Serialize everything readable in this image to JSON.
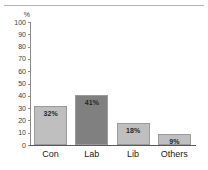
{
  "chart_data": {
    "type": "bar",
    "title": "",
    "subtitle": "",
    "xlabel": "",
    "ylabel": "%",
    "categories": [
      "Con",
      "Lab",
      "Lib",
      "Others"
    ],
    "values": [
      32,
      41,
      18,
      9
    ],
    "data_labels": [
      "32%",
      "41%",
      "18%",
      "9%"
    ],
    "colors": [
      "#BFBFBF",
      "#808080",
      "#BFBFBF",
      "#BFBFBF"
    ],
    "ylim": [
      0,
      100
    ],
    "ytick_labels": [
      "100",
      "90",
      "80",
      "70",
      "60",
      "50",
      "40",
      "30",
      "20",
      "10",
      "0"
    ],
    "ytick_values": [
      100,
      90,
      80,
      70,
      60,
      50,
      40,
      30,
      20,
      10,
      0
    ],
    "grid": false,
    "legend": "none",
    "series": [
      {
        "name": "Vote share",
        "values": [
          32,
          41,
          18,
          9
        ]
      }
    ]
  },
  "figure": {
    "unit_caption": "%",
    "background_color": "#FFFFFF",
    "axis_color": "#8C8C8C",
    "top_rule_color": "#B3B3B3",
    "bar_outline_color": "#9A9A9A",
    "label_text_color": "#262626"
  }
}
